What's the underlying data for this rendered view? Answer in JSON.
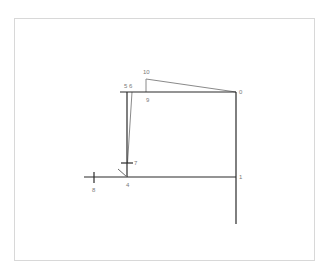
{
  "diagram": {
    "type": "node-graph",
    "colors": {
      "frame_border": "#d8d8d8",
      "primary_edge": "#2b2b2b",
      "secondary_edge": "#8a8a8a",
      "label": "#7a7a7a",
      "background": "#ffffff"
    },
    "nodes": [
      {
        "id": "0",
        "label": "0"
      },
      {
        "id": "1",
        "label": "1"
      },
      {
        "id": "4",
        "label": "4"
      },
      {
        "id": "5",
        "label": "5"
      },
      {
        "id": "6",
        "label": "6"
      },
      {
        "id": "7",
        "label": "7"
      },
      {
        "id": "8",
        "label": "8"
      },
      {
        "id": "9",
        "label": "9"
      },
      {
        "id": "10",
        "label": "10"
      }
    ],
    "labels": {
      "n0": "0",
      "n1": "1",
      "n4": "4",
      "n56": "5 6",
      "n7": "7",
      "n8": "8",
      "n9": "9",
      "n10": "10"
    },
    "edges": [
      {
        "from": "5",
        "to": "0",
        "style": "primary"
      },
      {
        "from": "0",
        "to": "1",
        "style": "primary"
      },
      {
        "from": "1",
        "to": "end",
        "style": "primary"
      },
      {
        "from": "8",
        "to": "1",
        "style": "primary"
      },
      {
        "from": "5",
        "to": "4",
        "style": "primary"
      },
      {
        "from": "6",
        "to": "7",
        "style": "secondary"
      },
      {
        "from": "9",
        "to": "10",
        "style": "secondary"
      },
      {
        "from": "10",
        "to": "0",
        "style": "secondary"
      }
    ]
  }
}
